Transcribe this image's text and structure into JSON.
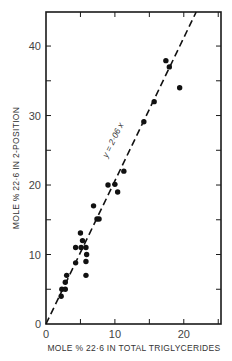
{
  "chart_data": {
    "type": "scatter",
    "title": "",
    "xlabel": "MOLE % 22·6 IN TOTAL TRIGLYCERIDES",
    "ylabel": "MOLE % 22·6 IN 2-POSITION",
    "xlim": [
      0,
      25.4
    ],
    "ylim": [
      0,
      44.9
    ],
    "grid": false,
    "legend": null,
    "x_ticks": [
      0,
      5,
      10,
      15,
      20,
      25
    ],
    "x_tick_labels": [
      "0",
      "",
      "10",
      "",
      "20",
      ""
    ],
    "y_ticks": [
      0,
      5,
      10,
      15,
      20,
      25,
      30,
      35,
      40
    ],
    "y_tick_labels": [
      "0",
      "",
      "10",
      "",
      "20",
      "",
      "30",
      "",
      "40"
    ],
    "series": [
      {
        "name": "observations",
        "marker": "filled-circle",
        "color": "#111111",
        "points": [
          [
            2.2,
            4.0
          ],
          [
            2.3,
            5.0
          ],
          [
            2.8,
            5.0
          ],
          [
            2.8,
            6.0
          ],
          [
            3.0,
            7.0
          ],
          [
            4.3,
            8.8
          ],
          [
            4.3,
            11.0
          ],
          [
            5.1,
            11.0
          ],
          [
            5.8,
            11.0
          ],
          [
            5.9,
            10.0
          ],
          [
            5.8,
            9.0
          ],
          [
            5.8,
            7.0
          ],
          [
            5.3,
            12.0
          ],
          [
            5.0,
            13.1
          ],
          [
            6.9,
            17.0
          ],
          [
            7.4,
            15.1
          ],
          [
            7.7,
            15.1
          ],
          [
            9.0,
            20.0
          ],
          [
            10.0,
            20.1
          ],
          [
            10.4,
            19.0
          ],
          [
            11.3,
            22.0
          ],
          [
            14.2,
            29.1
          ],
          [
            15.7,
            32.0
          ],
          [
            17.4,
            37.9
          ],
          [
            17.9,
            37.0
          ],
          [
            19.4,
            34.0
          ]
        ]
      },
      {
        "name": "regression",
        "type": "line",
        "style": "dashed",
        "color": "#111111",
        "equation": "y = 2.06 x",
        "slope": 2.06,
        "intercept": 0
      }
    ],
    "annotations": [
      {
        "text": "y = 2·06 x",
        "x": 10.1,
        "y": 26.3,
        "rotation": -64
      }
    ]
  },
  "labels": {
    "x_axis_title": "MOLE % 22·6 IN TOTAL TRIGLYCERIDES",
    "y_axis_title": "MOLE % 22·6 IN 2-POSITION",
    "equation": "y = 2·06 x"
  }
}
